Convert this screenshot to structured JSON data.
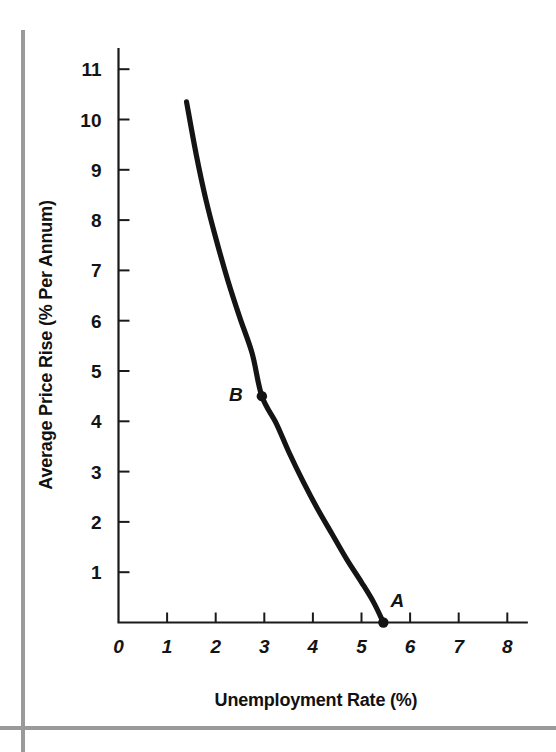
{
  "chart_data": {
    "type": "line",
    "title": "",
    "xlabel": "Unemployment Rate (%)",
    "ylabel": "Average Price Rise (% Per Annum)",
    "xlim": [
      0,
      8.4
    ],
    "ylim": [
      0,
      11.4
    ],
    "grid": false,
    "legend": "none",
    "x_ticks": [
      "0",
      "1",
      "2",
      "3",
      "4",
      "5",
      "6",
      "7",
      "8"
    ],
    "x_tick_values": [
      0,
      1,
      2,
      3,
      4,
      5,
      6,
      7,
      8
    ],
    "y_ticks": [
      "1",
      "2",
      "3",
      "4",
      "5",
      "6",
      "7",
      "8",
      "9",
      "10",
      "11"
    ],
    "y_tick_values": [
      1,
      2,
      3,
      4,
      5,
      6,
      7,
      8,
      9,
      10,
      11
    ],
    "series": [
      {
        "name": "Phillips Curve",
        "x": [
          1.4,
          1.6,
          1.8,
          2.0,
          2.25,
          2.5,
          2.75,
          2.95,
          3.25,
          3.5,
          3.8,
          4.1,
          4.4,
          4.7,
          5.0,
          5.25,
          5.45
        ],
        "values": [
          10.35,
          9.3,
          8.4,
          7.65,
          6.8,
          6.05,
          5.35,
          4.5,
          3.95,
          3.4,
          2.8,
          2.25,
          1.75,
          1.25,
          0.8,
          0.4,
          0.0
        ]
      }
    ],
    "annotations": [
      {
        "label": "A",
        "x": 5.45,
        "y": 0.0,
        "marker": true,
        "label_dx": 14,
        "label_dy": -16
      },
      {
        "label": "B",
        "x": 2.95,
        "y": 4.5,
        "marker": true,
        "label_dx": -26,
        "label_dy": 5
      }
    ]
  },
  "decor": {
    "rule_color": "#9a9a9a",
    "curve_color": "#141414",
    "axis_color": "#1a1a1a"
  }
}
